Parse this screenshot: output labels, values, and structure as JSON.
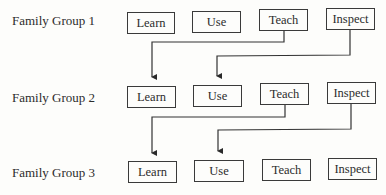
{
  "diagram": {
    "groups": [
      {
        "label": "Family Group 1",
        "boxes": [
          "Learn",
          "Use",
          "Teach",
          "Inspect"
        ]
      },
      {
        "label": "Family Group 2",
        "boxes": [
          "Learn",
          "Use",
          "Teach",
          "Inspect"
        ]
      },
      {
        "label": "Family Group 3",
        "boxes": [
          "Learn",
          "Use",
          "Teach",
          "Inspect"
        ]
      }
    ],
    "connections": [
      {
        "from": "Family Group 1 / Teach",
        "to": "Family Group 2 / Learn"
      },
      {
        "from": "Family Group 1 / Inspect",
        "to": "Family Group 2 / Use"
      },
      {
        "from": "Family Group 2 / Teach",
        "to": "Family Group 3 / Learn"
      },
      {
        "from": "Family Group 2 / Inspect",
        "to": "Family Group 3 / Use"
      }
    ]
  }
}
